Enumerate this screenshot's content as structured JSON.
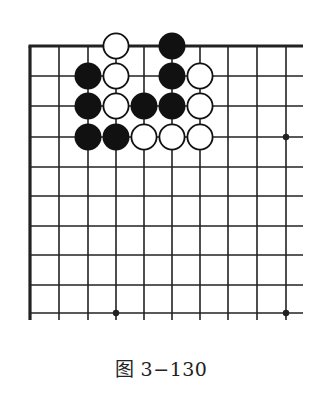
{
  "diagram": {
    "type": "go-board-fragment",
    "caption": "图 3−130",
    "colors": {
      "line": "#222222",
      "black_stone": "#111111",
      "white_stone": "#ffffff",
      "stone_outline": "#111111"
    },
    "grid": {
      "columns_x": [
        30,
        59,
        88,
        116,
        144,
        172,
        200,
        228,
        257,
        286
      ],
      "rows_y": [
        46,
        76,
        106,
        137,
        167,
        196,
        226,
        255,
        285,
        313
      ],
      "right_extent_x": 303,
      "bottom_extent_y": 320,
      "top_edge": "board-edge",
      "left_edge": "board-edge",
      "stone_diameter": 27
    },
    "stones": [
      {
        "color": "white",
        "col": 3,
        "row": 0
      },
      {
        "color": "black",
        "col": 5,
        "row": 0
      },
      {
        "color": "black",
        "col": 2,
        "row": 1
      },
      {
        "color": "white",
        "col": 3,
        "row": 1
      },
      {
        "color": "black",
        "col": 5,
        "row": 1
      },
      {
        "color": "white",
        "col": 6,
        "row": 1
      },
      {
        "color": "black",
        "col": 2,
        "row": 2
      },
      {
        "color": "white",
        "col": 3,
        "row": 2
      },
      {
        "color": "black",
        "col": 4,
        "row": 2
      },
      {
        "color": "black",
        "col": 5,
        "row": 2
      },
      {
        "color": "white",
        "col": 6,
        "row": 2
      },
      {
        "color": "black",
        "col": 2,
        "row": 3
      },
      {
        "color": "black",
        "col": 3,
        "row": 3
      },
      {
        "color": "white",
        "col": 4,
        "row": 3
      },
      {
        "color": "white",
        "col": 5,
        "row": 3
      },
      {
        "color": "white",
        "col": 6,
        "row": 3
      }
    ],
    "star_points": [
      {
        "col": 9,
        "row": 3
      },
      {
        "col": 3,
        "row": 9
      },
      {
        "col": 9,
        "row": 9
      }
    ]
  }
}
